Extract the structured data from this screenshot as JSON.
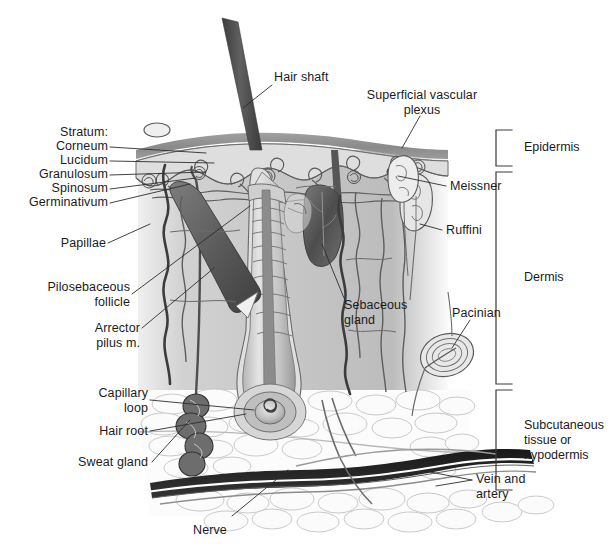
{
  "figure": {
    "background_color": "#ffffff",
    "text_color": "#1b1b1b"
  },
  "labels": {
    "hair_shaft": "Hair shaft",
    "superficial_vascular_plexus": "Superficial vascular\nplexus",
    "stratum_heading": "Stratum:",
    "stratum_corneum": "Corneum",
    "stratum_lucidum": "Lucidum",
    "stratum_granulosum": "Granulosum",
    "stratum_spinosum": "Spinosum",
    "stratum_germinativum": "Germinativum",
    "papillae": "Papillae",
    "pilosebaceous_follicle": "Pilosebaceous\nfollicle",
    "arrector_pilus": "Arrector\npilus m.",
    "capillary_loop": "Capillary\nloop",
    "hair_root": "Hair root",
    "sweat_gland": "Sweat gland",
    "sebaceous_gland": "Sebaceous\ngland",
    "meissner": "Meissner",
    "ruffini": "Ruffini",
    "pacinian": "Pacinian",
    "nerve": "Nerve",
    "vein_and_artery": "Vein and\nartery"
  },
  "layers": [
    {
      "name": "Epidermis",
      "label": "Epidermis"
    },
    {
      "name": "Dermis",
      "label": "Dermis"
    },
    {
      "name": "Subcutaneous",
      "label": "Subcutaneous\ntissue or\nhypodermis"
    }
  ],
  "colors": {
    "stratum_corneum": "#8e8e8e",
    "epidermis_body": "#d6d6d6",
    "dermis_fill": "#c9c9c9",
    "subcutaneous_fill": "#fafafa",
    "hair_dark": "#4a4a4a",
    "vessel_dark": "#2b2b2b",
    "outline": "#5a5a5a",
    "leader_line": "#3a3a3a"
  }
}
